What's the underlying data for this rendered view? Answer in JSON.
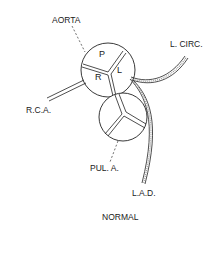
{
  "diagram": {
    "title": "NORMAL",
    "labels": {
      "aorta": "AORTA",
      "left_circumflex": "L. CIRC.",
      "right_coronary": "R.C.A.",
      "pulmonary_artery": "PUL. A.",
      "left_anterior_descending": "L.A.D."
    },
    "aortic_cusps": {
      "posterior": "P",
      "right": "R",
      "left": "L"
    },
    "colors": {
      "line": "#222222",
      "background": "#ffffff"
    }
  }
}
